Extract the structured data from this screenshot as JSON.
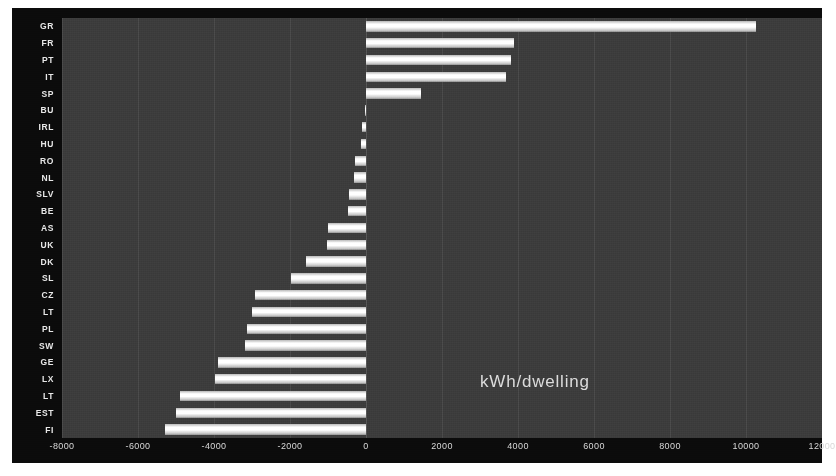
{
  "chart_data": {
    "type": "bar",
    "orientation": "horizontal",
    "title": "",
    "subtitle": "",
    "xlabel": "",
    "ylabel": "",
    "annotation": "kWh/dwelling",
    "xlim": [
      -8000,
      12000
    ],
    "xticks": [
      -8000,
      -6000,
      -4000,
      -2000,
      0,
      2000,
      4000,
      6000,
      8000,
      10000,
      12000
    ],
    "xticklabels": [
      "-8000",
      "-6000",
      "-4000",
      "-2000",
      "0",
      "2000",
      "4000",
      "6000",
      "8000",
      "10000",
      "12000"
    ],
    "grid": true,
    "legend": false,
    "categories": [
      "GR",
      "FR",
      "PT",
      "IT",
      "SP",
      "BU",
      "IRL",
      "HU",
      "RO",
      "NL",
      "SLV",
      "BE",
      "AS",
      "UK",
      "DK",
      "SL",
      "CZ",
      "LT",
      "PL",
      "SW",
      "GE",
      "LX",
      "LT",
      "EST",
      "FI"
    ],
    "values": [
      10250,
      3900,
      3820,
      3680,
      1440,
      -30,
      -110,
      -140,
      -300,
      -310,
      -440,
      -470,
      -1010,
      -1020,
      -1590,
      -1970,
      -2930,
      -3000,
      -3130,
      -3190,
      -3890,
      -3980,
      -4900,
      -5000,
      -5280
    ],
    "bar_color": "#ffffff",
    "background_color": "#3c3c3c",
    "figure_color": "#0b0b0b"
  },
  "axis": {
    "x_tick_labels": [
      "-8000",
      "-6000",
      "-4000",
      "-2000",
      "0",
      "2000",
      "4000",
      "6000",
      "8000",
      "10000",
      "12000"
    ],
    "y_tick_labels": [
      "GR",
      "FR",
      "PT",
      "IT",
      "SP",
      "BU",
      "IRL",
      "HU",
      "RO",
      "NL",
      "SLV",
      "BE",
      "AS",
      "UK",
      "DK",
      "SL",
      "CZ",
      "LT",
      "PL",
      "SW",
      "GE",
      "LX",
      "LT",
      "EST",
      "FI"
    ]
  },
  "annotation": {
    "units_label": "kWh/dwelling"
  }
}
